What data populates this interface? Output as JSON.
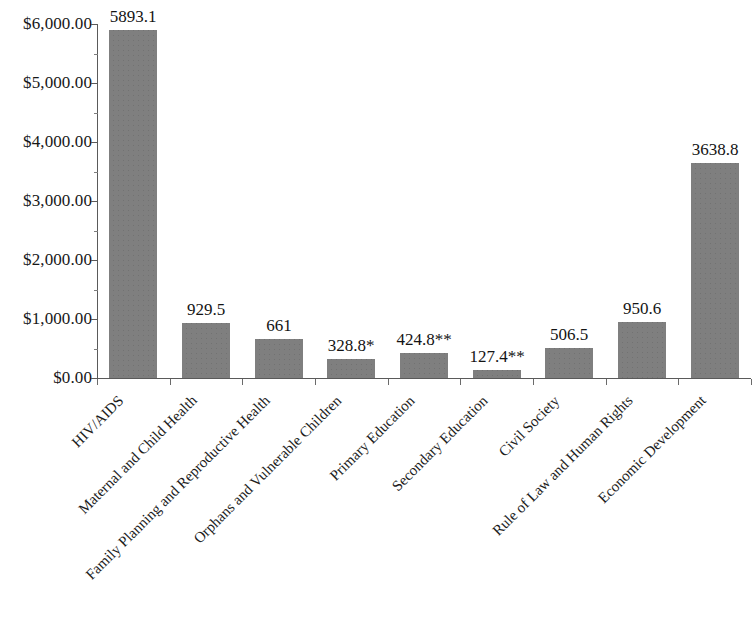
{
  "chart_data": {
    "type": "bar",
    "title": "",
    "subtitle": "",
    "xlabel": "",
    "ylabel": "",
    "ylim": [
      0,
      6000
    ],
    "y_tick_labels": [
      "$0.00",
      "$1,000.00",
      "$2,000.00",
      "$3,000.00",
      "$4,000.00",
      "$5,000.00",
      "$6,000.00"
    ],
    "y_tick_values": [
      0,
      1000,
      2000,
      3000,
      4000,
      5000,
      6000
    ],
    "y_minor_tick_values": [
      500,
      1500,
      2500,
      3500,
      4500,
      5500
    ],
    "grid": false,
    "legend": null,
    "legend_position": "none",
    "bar_color": "#7f7f7f",
    "axis_color": "#5a5a5a",
    "categories": [
      "HIV/AIDS",
      "Maternal and Child Health",
      "Family Planning and Reproductive Health",
      "Orphans and Vulnerable Children",
      "Primary Education",
      "Secondary Education",
      "Civil Society",
      "Rule of Law and Human Rights",
      "Economic Development"
    ],
    "values": [
      5893.1,
      929.5,
      661,
      328.8,
      424.8,
      127.4,
      506.5,
      950.6,
      3638.8
    ],
    "data_labels": [
      "5893.1",
      "929.5",
      "661",
      "328.8*",
      "424.8**",
      "127.4**",
      "506.5",
      "950.6",
      "3638.8"
    ],
    "annotations": []
  }
}
